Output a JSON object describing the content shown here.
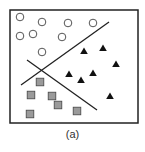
{
  "figure": {
    "caption": "(a)",
    "frame": {
      "x": 10,
      "y": 10,
      "width": 128,
      "height": 113,
      "stroke": "#222222"
    },
    "lines": [
      {
        "name": "separator-line-1",
        "x1": 21,
        "y1": 85,
        "x2": 109,
        "y2": 22
      },
      {
        "name": "separator-line-2",
        "x1": 27,
        "y1": 60,
        "x2": 97,
        "y2": 110
      }
    ],
    "classes": {
      "circles": {
        "marker": "open-circle",
        "fill": "#ffffff",
        "stroke": "#555555",
        "points": [
          [
            20,
            17
          ],
          [
            42,
            22
          ],
          [
            68,
            23
          ],
          [
            93,
            23
          ],
          [
            20,
            36
          ],
          [
            33,
            34
          ],
          [
            62,
            37
          ],
          [
            42,
            52
          ]
        ]
      },
      "triangles": {
        "marker": "filled-triangle",
        "fill": "#111111",
        "points": [
          [
            84,
            51
          ],
          [
            103,
            48
          ],
          [
            116,
            64
          ],
          [
            69,
            74
          ],
          [
            81,
            80
          ],
          [
            93,
            73
          ],
          [
            110,
            96
          ]
        ]
      },
      "squares": {
        "marker": "gray-square",
        "fill": "#9a9a9a",
        "stroke": "#444444",
        "points": [
          [
            40,
            82
          ],
          [
            31,
            95
          ],
          [
            52,
            96
          ],
          [
            58,
            105
          ],
          [
            30,
            114
          ],
          [
            77,
            111
          ]
        ]
      }
    }
  }
}
